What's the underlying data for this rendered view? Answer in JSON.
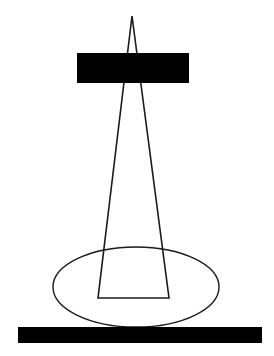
{
  "diagram": {
    "colors": {
      "stroke": "#1a1a1a",
      "fill_bar": "#000000",
      "background": "#ffffff"
    },
    "shapes": {
      "cone": {
        "apex": [
          132,
          16
        ],
        "base_left": [
          98,
          298
        ],
        "base_right": [
          169,
          298
        ]
      },
      "top_bar": {
        "x": 77,
        "y": 53,
        "width": 112,
        "height": 30
      },
      "ellipse": {
        "cx": 136,
        "cy": 287,
        "rx": 83,
        "ry": 40
      },
      "ground_bar": {
        "x": 18,
        "y": 327,
        "width": 244,
        "height": 16
      }
    }
  }
}
